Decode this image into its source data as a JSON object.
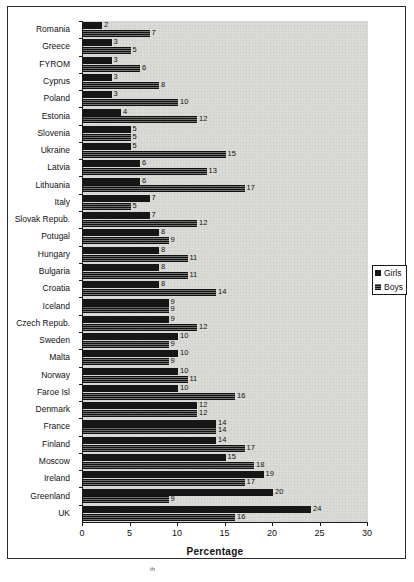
{
  "chart_data": {
    "type": "bar",
    "orientation": "horizontal",
    "title": "",
    "xlabel": "Percentage",
    "ylabel": "",
    "xlim": [
      0,
      30
    ],
    "xticks": [
      0,
      5,
      10,
      15,
      20,
      25,
      30
    ],
    "grid": false,
    "legend_position": "right",
    "categories": [
      "Romania",
      "Greece",
      "FYROM",
      "Cyprus",
      "Poland",
      "Estonia",
      "Slovenia",
      "Ukraine",
      "Latvia",
      "Lithuania",
      "Italy",
      "Slovak Repub.",
      "Potugal",
      "Hungary",
      "Bulgaria",
      "Croatia",
      "Iceland",
      "Czech Repub.",
      "Sweden",
      "Malta",
      "Norway",
      "Faroe Isl",
      "Denmark",
      "France",
      "Finland",
      "Moscow",
      "Ireland",
      "Greenland",
      "UK"
    ],
    "series": [
      {
        "name": "Girls",
        "color": "#161616",
        "values": [
          2,
          3,
          3,
          3,
          3,
          4,
          5,
          5,
          6,
          6,
          7,
          7,
          8,
          8,
          8,
          8,
          9,
          9,
          10,
          10,
          10,
          10,
          12,
          14,
          14,
          15,
          19,
          20,
          24
        ]
      },
      {
        "name": "Boys",
        "color": "#3a3a3a",
        "values": [
          7,
          5,
          6,
          8,
          10,
          12,
          5,
          15,
          13,
          17,
          5,
          12,
          9,
          11,
          11,
          14,
          9,
          12,
          9,
          9,
          11,
          16,
          12,
          14,
          17,
          18,
          17,
          9,
          16
        ]
      }
    ]
  },
  "legend": {
    "items": [
      {
        "label": "Girls"
      },
      {
        "label": "Boys"
      }
    ]
  },
  "axis": {
    "xlabel": "Percentage",
    "ticks": [
      "0",
      "5",
      "10",
      "15",
      "20",
      "25",
      "30"
    ]
  },
  "footnote": {
    "text": "th"
  }
}
